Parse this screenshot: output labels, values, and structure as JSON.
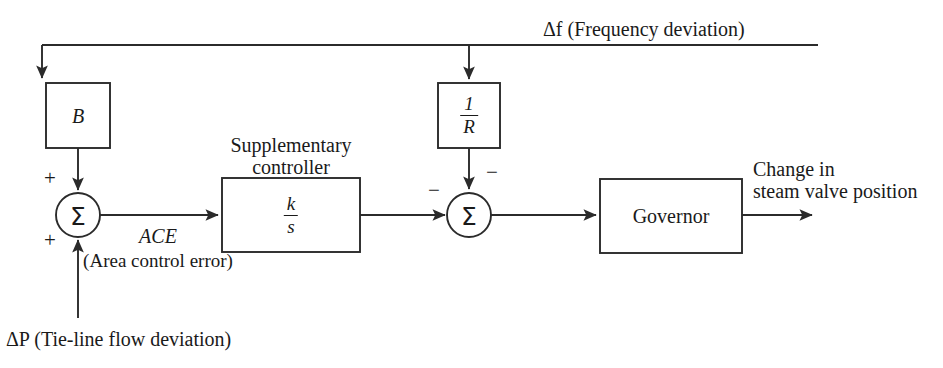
{
  "diagram": {
    "line_color": "#2b2b2b",
    "text_color": "#1a1a1a",
    "background": "#ffffff",
    "blocks": [
      {
        "id": "b",
        "label": "B",
        "kind": "gain"
      },
      {
        "id": "one_over_r",
        "numerator": "1",
        "denominator": "R",
        "kind": "fraction"
      },
      {
        "id": "supplementary_controller",
        "caption_line1": "Supplementary",
        "caption_line2": "controller",
        "numerator": "k",
        "denominator": "s",
        "kind": "fraction"
      },
      {
        "id": "governor",
        "label": "Governor",
        "kind": "plain"
      }
    ],
    "summing_junctions": [
      {
        "id": "left-sum",
        "symbol": "Σ",
        "signs": [
          "+",
          "+"
        ]
      },
      {
        "id": "right-sum",
        "symbol": "Σ",
        "signs": [
          "−",
          "−"
        ]
      }
    ],
    "signals": {
      "feedback_top": "Δf (Frequency deviation)",
      "ace_name": "ACE",
      "ace_expansion": "(Area control error)",
      "tie_line_input": "ΔP (Tie-line flow deviation)",
      "output_line1": "Change in",
      "output_line2": "steam valve position"
    },
    "signs": {
      "plus": "+",
      "minus": "−"
    }
  }
}
